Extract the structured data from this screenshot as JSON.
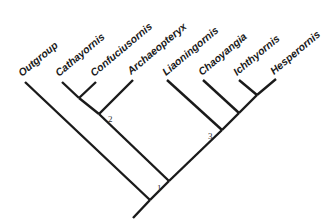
{
  "diagram": {
    "type": "cladogram",
    "taxa": [
      {
        "name": "Outgroup",
        "tip": [
          25,
          82
        ]
      },
      {
        "name": "Cathayornis",
        "tip": [
          62,
          82
        ]
      },
      {
        "name": "Confuciusornis",
        "tip": [
          96,
          82
        ]
      },
      {
        "name": "Archaeopteryx",
        "tip": [
          133,
          80
        ]
      },
      {
        "name": "Liaoningornis",
        "tip": [
          167,
          80
        ]
      },
      {
        "name": "Chaoyangia",
        "tip": [
          203,
          80
        ]
      },
      {
        "name": "Ichthyornis",
        "tip": [
          239,
          80
        ]
      },
      {
        "name": "Hesperornis",
        "tip": [
          276,
          79
        ]
      }
    ],
    "node_labels": [
      {
        "text": "2",
        "x": 108,
        "y": 122
      },
      {
        "text": "1",
        "x": 157,
        "y": 191
      },
      {
        "text": "3",
        "x": 208,
        "y": 139
      }
    ],
    "colors": {
      "line": "#1a1a1a",
      "background": "#ffffff"
    }
  }
}
